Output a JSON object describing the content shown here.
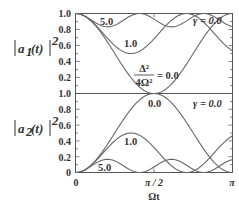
{
  "chart_data": {
    "type": "line",
    "panels": [
      {
        "ylabel": "|a1(t)|^2",
        "ylabel_parts": {
          "main": "a",
          "sub": "1",
          "arg": "(t)",
          "sup": "2"
        },
        "ylim": [
          0.0,
          1.0
        ],
        "yticks": [
          "1.0",
          "0.8",
          "0.6",
          "0.4",
          "0.2"
        ],
        "gamma_label": "γ = 0.0",
        "series": [
          {
            "name": "Δ²/4Ω² = 5.0",
            "label": "5.0",
            "param": 5.0,
            "quantity": "a1"
          },
          {
            "name": "Δ²/4Ω² = 1.0",
            "label": "1.0",
            "param": 1.0,
            "quantity": "a1"
          },
          {
            "name": "Δ²/4Ω² = 0.0",
            "label": "= 0.0",
            "param": 0.0,
            "quantity": "a1"
          }
        ],
        "annotation": {
          "fraction_num": "Δ²",
          "fraction_den": "4Ω²",
          "value": "= 0.0"
        }
      },
      {
        "ylabel": "|a2(t)|^2",
        "ylabel_parts": {
          "main": "a",
          "sub": "2",
          "arg": "(t)",
          "sup": "2"
        },
        "ylim": [
          0.0,
          1.0
        ],
        "yticks": [
          "1.0",
          "0.8",
          "0.6",
          "0.4",
          "0.2",
          "0"
        ],
        "gamma_label": "γ = 0.0",
        "series": [
          {
            "name": "Δ²/4Ω² = 0.0",
            "label": "0.0",
            "param": 0.0,
            "quantity": "a2"
          },
          {
            "name": "Δ²/4Ω² = 1.0",
            "label": "1.0",
            "param": 1.0,
            "quantity": "a2"
          },
          {
            "name": "Δ²/4Ω² = 5.0",
            "label": "5.0",
            "param": 5.0,
            "quantity": "a2"
          }
        ]
      }
    ],
    "x": {
      "label": "Ωt",
      "range": [
        0,
        3.14159
      ],
      "ticks": [
        "0",
        "π / 2",
        "π"
      ]
    },
    "sample_points": {
      "a2_param_0.0": {
        "x": [
          0,
          0.785,
          1.571,
          2.356,
          3.142
        ],
        "y": [
          0,
          0.5,
          1.0,
          0.5,
          0
        ]
      },
      "a2_param_1.0": {
        "x": [
          0,
          1.111,
          2.221,
          3.142
        ],
        "y": [
          0,
          0.5,
          0,
          0.49
        ]
      },
      "a2_param_5.0": {
        "x": [
          0,
          0.641,
          1.283,
          1.924,
          2.565,
          3.142
        ],
        "y": [
          0,
          0.167,
          0,
          0.167,
          0,
          0.15
        ]
      },
      "a1": "1 - a2"
    },
    "grid": false,
    "legend": "inline labels"
  }
}
